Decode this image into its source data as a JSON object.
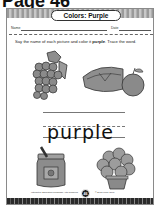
{
  "page": {
    "heading": "Page 46"
  },
  "worksheet": {
    "title": "Colors: Purple",
    "name_label": "Name",
    "date_label": "Date",
    "instruction_prefix": "Say the name of each picture and color it ",
    "instruction_bold": "purple",
    "instruction_suffix": ". Trace the word.",
    "trace_word": "purple",
    "pictures": [
      {
        "name": "grapes"
      },
      {
        "name": "plum pie"
      },
      {
        "name": "jar of jam"
      },
      {
        "name": "flower plant"
      }
    ],
    "footer": {
      "left_text": "Interactive Education Language Arts Teachers",
      "page_number": "46",
      "right_text": "© Evan-Moor Corp."
    }
  }
}
